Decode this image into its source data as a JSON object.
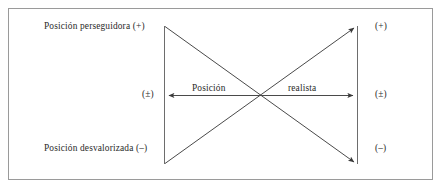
{
  "figure": {
    "background_color": "#ffffff",
    "frame_color": "#9a9a9a",
    "line_color": "#555555",
    "text_color": "#2a2a2a",
    "labels": {
      "top_left": "Posición perseguidora (+)",
      "bottom_left": "Posición desvalorizada (–)",
      "mid_left": "(±)",
      "right_top": "(+)",
      "right_mid": "(±)",
      "right_bottom": "(–)",
      "axis_word_left": "Posición",
      "axis_word_right": "realista"
    }
  }
}
